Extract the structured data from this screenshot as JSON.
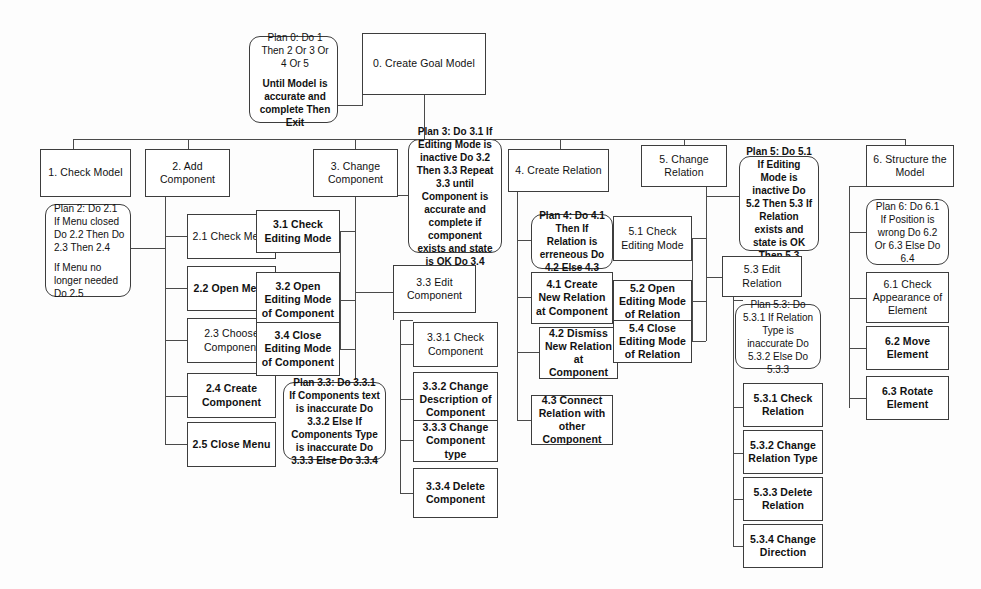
{
  "diagram": {
    "root": {
      "label": "0. Create Goal Model"
    },
    "plans": {
      "plan0_line1": "Plan 0: Do 1 Then 2 Or 3 Or 4 Or 5",
      "plan0_line2": "Until Model is accurate and complete Then Exit",
      "plan2_line1": "Plan 2: Do 2.1 If Menu closed Do 2.2 Then Do 2.3 Then 2.4",
      "plan2_line2": "If Menu no longer needed Do 2.5",
      "plan3": "Plan 3: Do 3.1 If Editing Mode is inactive Do 3.2 Then 3.3 Repeat 3.3 until Component is accurate and complete if component exists and state is OK Do 3.4",
      "plan33": "Plan 3.3: Do 3.3.1 If Components text is inaccurate Do 3.3.2 Else If Components Type is inaccurate Do 3.3.3 Else Do 3.3.4",
      "plan4": "Plan 4: Do 4.1 Then If Relation is  erreneous Do 4.2 Else 4.3",
      "plan5": "Plan 5: Do 5.1 If Editing Mode is inactive Do 5.2 Then 5.3 If Relation exists and state is OK Then 5.3",
      "plan53": "Plan 5.3: Do 5.3.1 If Relation Type is inaccurate Do 5.3.2 Else Do 5.3.3",
      "plan6": "Plan 6: Do 6.1 If Position is wrong Do 6.2 Or 6.3 Else Do 6.4"
    },
    "level1": [
      {
        "label": "1. Check Model"
      },
      {
        "label": "2. Add Component"
      },
      {
        "label": "3. Change Component"
      },
      {
        "label": "4. Create Relation"
      },
      {
        "label": "5. Change Relation"
      },
      {
        "label": "6. Structure the Model"
      }
    ],
    "branch2": [
      {
        "label": "2.1 Check Menu"
      },
      {
        "label": "2.2 Open Menu"
      },
      {
        "label": "2.3 Choose Component"
      },
      {
        "label": "2.4 Create Component"
      },
      {
        "label": "2.5 Close Menu"
      }
    ],
    "branch3": [
      {
        "label": "3.1 Check Editing Mode"
      },
      {
        "label": "3.2 Open Editing Mode of Component"
      },
      {
        "label": "3.4 Close Editing Mode of Component"
      },
      {
        "label": "3.3 Edit Component"
      }
    ],
    "branch33": [
      {
        "label": "3.3.1 Check Component"
      },
      {
        "label": "3.3.2 Change Description of Component"
      },
      {
        "label": "3.3.3 Change Component type"
      },
      {
        "label": "3.3.4 Delete Component"
      }
    ],
    "branch4": [
      {
        "label": "4.1 Create New Relation at Component"
      },
      {
        "label": "4.2 Dismiss New Relation at Component"
      },
      {
        "label": "4.3 Connect Relation with other Component"
      }
    ],
    "branch5": [
      {
        "label": "5.1 Check Editing Mode"
      },
      {
        "label": "5.2 Open Editing Mode of Relation"
      },
      {
        "label": "5.4 Close Editing Mode of Relation"
      },
      {
        "label": "5.3 Edit Relation"
      }
    ],
    "branch53": [
      {
        "label": "5.3.1 Check Relation"
      },
      {
        "label": "5.3.2 Change Relation Type"
      },
      {
        "label": "5.3.3 Delete Relation"
      },
      {
        "label": "5.3.4 Change Direction"
      }
    ],
    "branch6": [
      {
        "label": "6.1 Check Appearance of Element"
      },
      {
        "label": "6.2 Move Element"
      },
      {
        "label": "6.3 Rotate Element"
      }
    ],
    "colors": {
      "line": "#4a4a4a",
      "border": "#3d3d3d",
      "text": "#111111",
      "background": "#fdfdfd"
    }
  }
}
